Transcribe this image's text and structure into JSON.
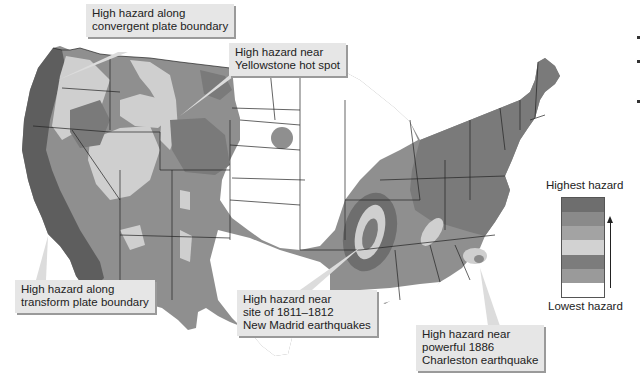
{
  "figure": {
    "callouts": [
      {
        "id": "convergent",
        "lines": [
          "High hazard along",
          "convergent plate boundary"
        ]
      },
      {
        "id": "yellowstone",
        "lines": [
          "High hazard near",
          "Yellowstone hot spot"
        ]
      },
      {
        "id": "transform",
        "lines": [
          "High hazard along",
          "transform plate boundary"
        ]
      },
      {
        "id": "new-madrid",
        "lines": [
          "High hazard near",
          "site of 1811–1812",
          "New Madrid earthquakes"
        ]
      },
      {
        "id": "charleston",
        "lines": [
          "High hazard near",
          "powerful 1886",
          "Charleston earthquake"
        ]
      }
    ]
  },
  "legend": {
    "top_label": "Highest hazard",
    "bottom_label": "Lowest hazard",
    "bands": [
      {
        "level": 7,
        "color": "#6e6e6e"
      },
      {
        "level": 6,
        "color": "#8a8a8a"
      },
      {
        "level": 5,
        "color": "#a3a3a3"
      },
      {
        "level": 4,
        "color": "#d2d2d2"
      },
      {
        "level": 3,
        "color": "#7c7c7c"
      },
      {
        "level": 2,
        "color": "#9a9a9a"
      },
      {
        "level": 1,
        "color": "#ffffff"
      }
    ]
  },
  "colors": {
    "very_high": "#5e5e5e",
    "high": "#7a7a7a",
    "medium": "#8f8f8f",
    "light": "#cfcfcf",
    "outline": "#222222",
    "background": "#ffffff"
  }
}
